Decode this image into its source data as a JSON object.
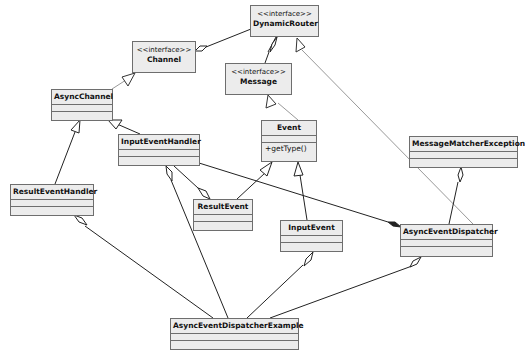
{
  "diagram": {
    "classes": {
      "dynamic_router": {
        "stereotype": "<<interface>>",
        "name": "DynamicRouter"
      },
      "channel": {
        "stereotype": "<<interface>>",
        "name": "Channel"
      },
      "message": {
        "stereotype": "<<interface>>",
        "name": "Message"
      },
      "async_channel": {
        "name": "AsyncChannel"
      },
      "input_event_handler": {
        "name": "InputEventHandler"
      },
      "event": {
        "name": "Event",
        "operations": [
          "+getType()"
        ]
      },
      "message_matcher_exception": {
        "name": "MessageMatcherException"
      },
      "result_event_handler": {
        "name": "ResultEventHandler"
      },
      "result_event": {
        "name": "ResultEvent"
      },
      "input_event": {
        "name": "InputEvent"
      },
      "async_event_dispatcher": {
        "name": "AsyncEventDispatcher"
      },
      "async_event_dispatcher_example": {
        "name": "AsyncEventDispatcherExample"
      }
    },
    "relationships": [
      {
        "from": "DynamicRouter",
        "to": "Channel",
        "type": "aggregation"
      },
      {
        "from": "DynamicRouter",
        "to": "Message",
        "type": "aggregation"
      },
      {
        "from": "AsyncChannel",
        "to": "Channel",
        "type": "realization"
      },
      {
        "from": "Event",
        "to": "Message",
        "type": "realization"
      },
      {
        "from": "AsyncEventDispatcher",
        "to": "DynamicRouter",
        "type": "realization"
      },
      {
        "from": "InputEventHandler",
        "to": "AsyncChannel",
        "type": "generalization"
      },
      {
        "from": "ResultEventHandler",
        "to": "AsyncChannel",
        "type": "generalization"
      },
      {
        "from": "ResultEvent",
        "to": "Event",
        "type": "generalization"
      },
      {
        "from": "InputEvent",
        "to": "Event",
        "type": "generalization"
      },
      {
        "from": "InputEventHandler",
        "to": "ResultEvent",
        "type": "aggregation"
      },
      {
        "from": "InputEventHandler",
        "to": "AsyncEventDispatcher",
        "type": "composition"
      },
      {
        "from": "AsyncEventDispatcher",
        "to": "MessageMatcherException",
        "type": "aggregation"
      },
      {
        "from": "AsyncEventDispatcherExample",
        "to": "ResultEventHandler",
        "type": "aggregation"
      },
      {
        "from": "AsyncEventDispatcherExample",
        "to": "InputEventHandler",
        "type": "aggregation"
      },
      {
        "from": "AsyncEventDispatcherExample",
        "to": "InputEvent",
        "type": "aggregation"
      },
      {
        "from": "AsyncEventDispatcherExample",
        "to": "AsyncEventDispatcher",
        "type": "aggregation"
      }
    ]
  }
}
